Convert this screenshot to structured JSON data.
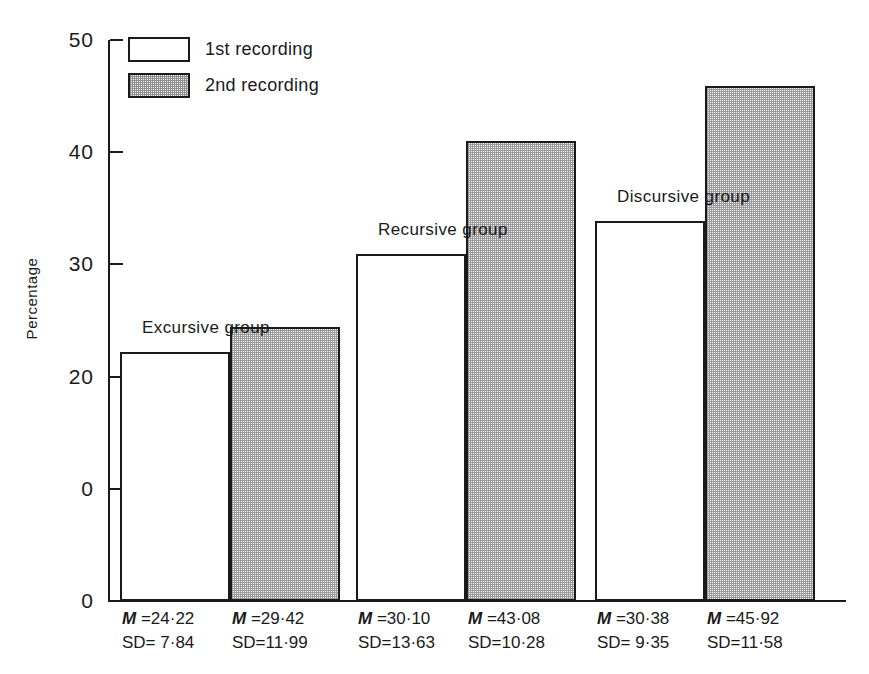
{
  "chart_data": {
    "type": "bar",
    "title": "",
    "subtitle": "",
    "xlabel": "",
    "ylabel": "Percentage",
    "ylim": [
      0,
      50
    ],
    "yticks": [
      0,
      10,
      20,
      30,
      40,
      50
    ],
    "ytick_labels": [
      "0",
      "0",
      "20",
      "30",
      "40",
      "50"
    ],
    "grid": false,
    "legend_position": "top-left",
    "categories": [
      "Excursive group",
      "Recursive group",
      "Discursive group"
    ],
    "series": [
      {
        "name": "1st recording",
        "values": [
          22.2,
          30.9,
          33.9
        ],
        "fill": "open"
      },
      {
        "name": "2nd recording",
        "values": [
          24.4,
          41.0,
          45.9
        ],
        "fill": "stipple"
      }
    ],
    "annotations": [
      {
        "group": "Excursive group",
        "series": "1st recording",
        "mean": "24·22",
        "sd": " 7·84"
      },
      {
        "group": "Excursive group",
        "series": "2nd recording",
        "mean": "29·42",
        "sd": "11·99"
      },
      {
        "group": "Recursive group",
        "series": "1st recording",
        "mean": "30·10",
        "sd": "13·63"
      },
      {
        "group": "Recursive group",
        "series": "2nd recording",
        "mean": "43·08",
        "sd": "10·28"
      },
      {
        "group": "Discursive group",
        "series": "1st recording",
        "mean": "30·38",
        "sd": " 9·35"
      },
      {
        "group": "Discursive group",
        "series": "2nd recording",
        "mean": "45·92",
        "sd": "11·58"
      }
    ]
  },
  "axis": {
    "y_title": "Percentage",
    "ticks": [
      {
        "label": "50",
        "value": 50
      },
      {
        "label": "40",
        "value": 40
      },
      {
        "label": "30",
        "value": 30
      },
      {
        "label": "20",
        "value": 20
      },
      {
        "label": "0",
        "value": 10
      },
      {
        "label": "0",
        "value": 0
      }
    ]
  },
  "legend": {
    "items": [
      {
        "label": "1st recording",
        "fill": "open"
      },
      {
        "label": "2nd recording",
        "fill": "stipple"
      }
    ]
  },
  "groups": [
    {
      "title": "Excursive group",
      "bars": [
        {
          "fill": "open",
          "value": 22.2,
          "m_prefix": "M",
          "m_eq": "=",
          "mean": "24·22",
          "sd_prefix": "SD=",
          "sd": " 7·84"
        },
        {
          "fill": "stipple",
          "value": 24.4,
          "m_prefix": "M",
          "m_eq": "=",
          "mean": "29·42",
          "sd_prefix": "SD=",
          "sd": "11·99"
        }
      ]
    },
    {
      "title": "Recursive group",
      "bars": [
        {
          "fill": "open",
          "value": 30.9,
          "m_prefix": "M",
          "m_eq": "=",
          "mean": "30·10",
          "sd_prefix": "SD=",
          "sd": "13·63"
        },
        {
          "fill": "stipple",
          "value": 41.0,
          "m_prefix": "M",
          "m_eq": "=",
          "mean": "43·08",
          "sd_prefix": "SD=",
          "sd": "10·28"
        }
      ]
    },
    {
      "title": "Discursive group",
      "bars": [
        {
          "fill": "open",
          "value": 33.9,
          "m_prefix": "M",
          "m_eq": "=",
          "mean": "30·38",
          "sd_prefix": "SD=",
          "sd": " 9·35"
        },
        {
          "fill": "stipple",
          "value": 45.9,
          "m_prefix": "M",
          "m_eq": "=",
          "mean": "45·92",
          "sd_prefix": "SD=",
          "sd": "11·58"
        }
      ]
    }
  ],
  "colors": {
    "ink": "#1a1a1a",
    "background": "#ffffff",
    "stipple": "#9a9a9a"
  }
}
